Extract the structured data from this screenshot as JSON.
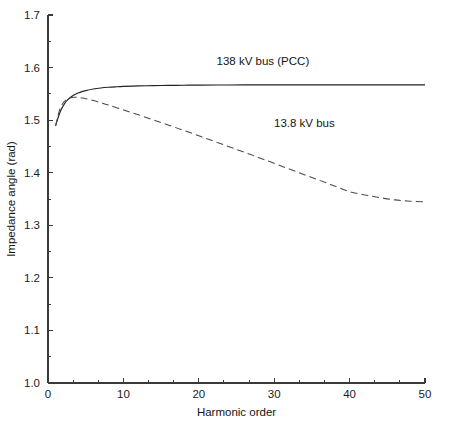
{
  "chart_data": {
    "type": "line",
    "title": "",
    "xlabel": "Harmonic order",
    "ylabel": "Impedance angle (rad)",
    "xlim": [
      0,
      50
    ],
    "ylim": [
      1.0,
      1.7
    ],
    "grid": false,
    "legend_position": "inline-annotations",
    "x_ticks": [
      0,
      10,
      20,
      30,
      40,
      50
    ],
    "x_tick_labels": [
      "0",
      "10",
      "20",
      "30",
      "40",
      "50"
    ],
    "x_minor_step": 3.3333,
    "y_ticks": [
      1.0,
      1.1,
      1.2,
      1.3,
      1.4,
      1.5,
      1.6,
      1.7
    ],
    "y_tick_labels": [
      "1.0",
      "1.1",
      "1.2",
      "1.3",
      "1.4",
      "1.5",
      "1.6",
      "1.7"
    ],
    "y_minor_step": 0.05,
    "series": [
      {
        "name": "138 kV bus (PCC)",
        "style": "solid",
        "color": "#222222",
        "label_x": 28.5,
        "label_y": 1.605,
        "x": [
          1,
          1.4,
          1.8,
          2.2,
          2.6,
          3,
          3.5,
          4,
          4.5,
          5,
          6,
          7,
          8,
          9,
          10,
          12,
          14,
          16,
          18,
          20,
          24,
          28,
          32,
          36,
          40,
          44,
          47,
          50
        ],
        "y": [
          1.4895,
          1.5075,
          1.5215,
          1.5315,
          1.5385,
          1.5435,
          1.5485,
          1.5518,
          1.5543,
          1.5562,
          1.5592,
          1.5612,
          1.5625,
          1.5634,
          1.5641,
          1.5651,
          1.5657,
          1.5661,
          1.5664,
          1.5666,
          1.5669,
          1.567,
          1.5671,
          1.5671,
          1.5672,
          1.5672,
          1.5672,
          1.5672
        ]
      },
      {
        "name": "13.8 kV bus",
        "style": "dashed",
        "color": "#4c4c4c",
        "label_x": 34.0,
        "label_y": 1.487,
        "x": [
          1,
          1.5,
          2,
          2.5,
          3,
          3.5,
          4,
          4.5,
          5,
          6,
          7,
          8,
          10,
          12,
          14,
          16,
          18,
          20,
          22,
          24,
          26,
          28,
          30,
          32,
          34,
          36,
          38,
          40,
          42,
          44,
          46,
          48,
          50
        ],
        "y": [
          1.4885,
          1.5175,
          1.5325,
          1.5395,
          1.5425,
          1.5435,
          1.5432,
          1.5422,
          1.5408,
          1.5372,
          1.5331,
          1.5288,
          1.5196,
          1.5101,
          1.5004,
          1.4905,
          1.4805,
          1.4703,
          1.46,
          1.4496,
          1.4391,
          1.4285,
          1.4178,
          1.4071,
          1.3963,
          1.3856,
          1.3748,
          1.364,
          1.3578,
          1.3527,
          1.3483,
          1.3458,
          1.3447
        ]
      }
    ]
  },
  "plot_geometry": {
    "left": 48,
    "right": 425,
    "top": 15,
    "bottom": 383
  }
}
